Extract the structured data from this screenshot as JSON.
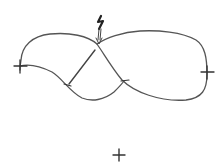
{
  "diagram": {
    "stroke_color": "#555555",
    "mark_color": "#333333",
    "background": "#ffffff",
    "elements": [
      {
        "name": "figure-eight-curve",
        "type": "closed-curve"
      },
      {
        "name": "left-end-tick",
        "type": "cross-mark"
      },
      {
        "name": "right-end-tick",
        "type": "cross-mark"
      },
      {
        "name": "crossing-segment",
        "type": "line"
      },
      {
        "name": "lower-left-tick",
        "type": "tick"
      },
      {
        "name": "lower-right-tick",
        "type": "tick"
      },
      {
        "name": "lightning-arrow",
        "type": "arrow",
        "target": "crossing"
      },
      {
        "name": "plus-mark",
        "type": "plus-sign"
      }
    ]
  }
}
